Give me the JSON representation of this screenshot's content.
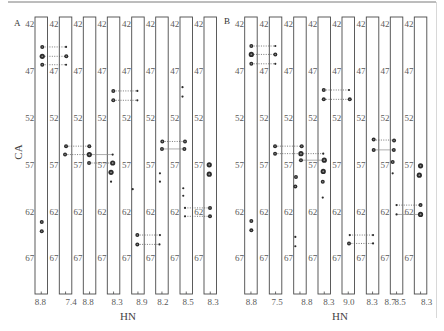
{
  "figure": {
    "panel_labels": [
      "A",
      "B"
    ]
  },
  "chart_data": [
    {
      "type": "scatter",
      "panel": "A",
      "title": "",
      "xlabel": "HN",
      "ylabel": "CA",
      "ca_range": [
        41.2,
        70.8
      ],
      "y_ticks": [
        42,
        47,
        52,
        57,
        62,
        67
      ],
      "grid": false,
      "strip_count": 8,
      "x_tick_labels": [
        {
          "strip": 0,
          "label": "8.8"
        },
        {
          "strip": 1,
          "label": "7.4"
        },
        {
          "strip": 2,
          "label": "8.8"
        },
        {
          "strip": 3,
          "label": "8.3"
        },
        {
          "strip": 4,
          "label": "8.9"
        },
        {
          "strip": 5,
          "label": "8.2"
        },
        {
          "strip": 6,
          "label": "8.5"
        },
        {
          "strip": 7,
          "label": "8.3"
        }
      ],
      "peaks": [
        {
          "id": "a0",
          "strip": 0,
          "ca": 44.4,
          "hn_rel": 0.08,
          "intensity": 2
        },
        {
          "id": "a1",
          "strip": 0,
          "ca": 45.4,
          "hn_rel": 0.08,
          "intensity": 3
        },
        {
          "id": "a2",
          "strip": 0,
          "ca": 46.3,
          "hn_rel": 0.08,
          "intensity": 2
        },
        {
          "id": "a3",
          "strip": 0,
          "ca": 63.1,
          "hn_rel": 0.04,
          "intensity": 2
        },
        {
          "id": "a4",
          "strip": 0,
          "ca": 64.1,
          "hn_rel": 0.04,
          "intensity": 2
        },
        {
          "id": "a5",
          "strip": 1,
          "ca": 44.4,
          "hn_rel": 0.04,
          "intensity": 1
        },
        {
          "id": "a6",
          "strip": 1,
          "ca": 45.4,
          "hn_rel": 0.06,
          "intensity": 2
        },
        {
          "id": "a7",
          "strip": 1,
          "ca": 46.3,
          "hn_rel": 0.04,
          "intensity": 1
        },
        {
          "id": "a8",
          "strip": 1,
          "ca": 55.0,
          "hn_rel": 0.04,
          "intensity": 2
        },
        {
          "id": "a9",
          "strip": 1,
          "ca": 55.9,
          "hn_rel": -0.04,
          "intensity": 2
        },
        {
          "id": "a10",
          "strip": 2,
          "ca": 55.0,
          "hn_rel": -0.02,
          "intensity": 2
        },
        {
          "id": "a11",
          "strip": 2,
          "ca": 55.9,
          "hn_rel": -0.02,
          "intensity": 3
        },
        {
          "id": "a12",
          "strip": 2,
          "ca": 56.8,
          "hn_rel": -0.04,
          "intensity": 2
        },
        {
          "id": "a13",
          "strip": 3,
          "ca": 49.1,
          "hn_rel": -0.02,
          "intensity": 2
        },
        {
          "id": "a14",
          "strip": 3,
          "ca": 50.1,
          "hn_rel": -0.02,
          "intensity": 2
        },
        {
          "id": "a15",
          "strip": 3,
          "ca": 55.9,
          "hn_rel": -0.07,
          "intensity": 1
        },
        {
          "id": "a16",
          "strip": 3,
          "ca": 56.8,
          "hn_rel": -0.07,
          "intensity": 3
        },
        {
          "id": "a17",
          "strip": 3,
          "ca": 57.8,
          "hn_rel": -0.2,
          "intensity": 3
        },
        {
          "id": "a18",
          "strip": 3,
          "ca": 58.8,
          "hn_rel": -0.2,
          "intensity": 1
        },
        {
          "id": "a19",
          "strip": 4,
          "ca": 49.1,
          "hn_rel": -0.05,
          "intensity": 1
        },
        {
          "id": "a20",
          "strip": 4,
          "ca": 50.1,
          "hn_rel": -0.05,
          "intensity": 1
        },
        {
          "id": "a21",
          "strip": 4,
          "ca": 59.6,
          "hn_rel": -0.42,
          "intensity": 1
        },
        {
          "id": "a22",
          "strip": 4,
          "ca": 64.5,
          "hn_rel": -0.05,
          "intensity": 2
        },
        {
          "id": "a23",
          "strip": 4,
          "ca": 65.5,
          "hn_rel": -0.05,
          "intensity": 2
        },
        {
          "id": "a24",
          "strip": 5,
          "ca": 54.5,
          "hn_rel": 0.03,
          "intensity": 2
        },
        {
          "id": "a25",
          "strip": 5,
          "ca": 55.3,
          "hn_rel": 0.0,
          "intensity": 2
        },
        {
          "id": "a26",
          "strip": 5,
          "ca": 57.9,
          "hn_rel": -0.16,
          "intensity": 1
        },
        {
          "id": "a27",
          "strip": 5,
          "ca": 58.8,
          "hn_rel": -0.16,
          "intensity": 1
        },
        {
          "id": "a28",
          "strip": 5,
          "ca": 64.5,
          "hn_rel": -0.16,
          "intensity": 1
        },
        {
          "id": "a29",
          "strip": 5,
          "ca": 65.5,
          "hn_rel": -0.2,
          "intensity": 1
        },
        {
          "id": "a30",
          "strip": 6,
          "ca": 48.7,
          "hn_rel": -0.3,
          "intensity": 1
        },
        {
          "id": "a31",
          "strip": 6,
          "ca": 49.7,
          "hn_rel": -0.3,
          "intensity": 1
        },
        {
          "id": "a32",
          "strip": 6,
          "ca": 54.5,
          "hn_rel": -0.1,
          "intensity": 2
        },
        {
          "id": "a33",
          "strip": 6,
          "ca": 55.3,
          "hn_rel": -0.15,
          "intensity": 2
        },
        {
          "id": "a34",
          "strip": 6,
          "ca": 59.5,
          "hn_rel": -0.24,
          "intensity": 1
        },
        {
          "id": "a35",
          "strip": 6,
          "ca": 60.3,
          "hn_rel": -0.24,
          "intensity": 1
        },
        {
          "id": "a36",
          "strip": 6,
          "ca": 61.6,
          "hn_rel": -0.1,
          "intensity": 1
        },
        {
          "id": "a37",
          "strip": 6,
          "ca": 62.5,
          "hn_rel": -0.1,
          "intensity": 1
        },
        {
          "id": "a38",
          "strip": 7,
          "ca": 57.0,
          "hn_rel": -0.08,
          "intensity": 3
        },
        {
          "id": "a39",
          "strip": 7,
          "ca": 58.0,
          "hn_rel": -0.08,
          "intensity": 3
        },
        {
          "id": "a40",
          "strip": 7,
          "ca": 61.6,
          "hn_rel": -0.02,
          "intensity": 2
        },
        {
          "id": "a41",
          "strip": 7,
          "ca": 62.5,
          "hn_rel": -0.02,
          "intensity": 2
        }
      ],
      "connections": [
        {
          "from": "a0",
          "to": "a5",
          "style": "dotted"
        },
        {
          "from": "a1",
          "to": "a6",
          "style": "dotted"
        },
        {
          "from": "a2",
          "to": "a7",
          "style": "dotted"
        },
        {
          "from": "a8",
          "to": "a10",
          "style": "dotted"
        },
        {
          "from": "a9",
          "to": "a11",
          "style": "dotted"
        },
        {
          "from": "a11",
          "to": "a15",
          "style": "solid"
        },
        {
          "from": "a12",
          "to": "a16",
          "style": "dotted"
        },
        {
          "from": "a13",
          "to": "a19",
          "style": "dotted"
        },
        {
          "from": "a14",
          "to": "a20",
          "style": "dotted"
        },
        {
          "from": "a22",
          "to": "a28",
          "style": "dotted"
        },
        {
          "from": "a23",
          "to": "a29",
          "style": "dotted"
        },
        {
          "from": "a24",
          "to": "a32",
          "style": "dotted"
        },
        {
          "from": "a25",
          "to": "a33",
          "style": "solid"
        },
        {
          "from": "a36",
          "to": "a40",
          "style": "dotted"
        },
        {
          "from": "a37",
          "to": "a41",
          "style": "dotted"
        }
      ]
    },
    {
      "type": "scatter",
      "panel": "B",
      "title": "",
      "xlabel": "HN",
      "ylabel": "",
      "ca_range": [
        41.2,
        70.8
      ],
      "y_ticks": [
        42,
        47,
        52,
        57,
        62,
        67
      ],
      "grid": false,
      "strip_count": 8,
      "x_tick_labels": [
        {
          "strip": 0,
          "label": "8.8"
        },
        {
          "strip": 1,
          "label": "7.5"
        },
        {
          "strip": 2,
          "label": "8.8"
        },
        {
          "strip": 3,
          "label": "8.3"
        },
        {
          "strip": 4,
          "label": "9.0"
        },
        {
          "strip": 5,
          "label": "8.3"
        },
        {
          "strip": 6,
          "label": "8.7"
        },
        {
          "strip": 6,
          "label": "8.5"
        },
        {
          "strip": 7,
          "label": "8.3"
        }
      ],
      "peaks": [
        {
          "id": "b0",
          "strip": 0,
          "ca": 44.3,
          "hn_rel": 0.03,
          "intensity": 2
        },
        {
          "id": "b1",
          "strip": 0,
          "ca": 45.2,
          "hn_rel": 0.03,
          "intensity": 3
        },
        {
          "id": "b2",
          "strip": 0,
          "ca": 46.2,
          "hn_rel": 0.03,
          "intensity": 2
        },
        {
          "id": "b3",
          "strip": 0,
          "ca": 63.0,
          "hn_rel": 0.03,
          "intensity": 2
        },
        {
          "id": "b4",
          "strip": 0,
          "ca": 64.0,
          "hn_rel": 0.03,
          "intensity": 2
        },
        {
          "id": "b5",
          "strip": 1,
          "ca": 44.3,
          "hn_rel": -0.02,
          "intensity": 1
        },
        {
          "id": "b6",
          "strip": 1,
          "ca": 45.2,
          "hn_rel": -0.02,
          "intensity": 2
        },
        {
          "id": "b7",
          "strip": 1,
          "ca": 46.2,
          "hn_rel": -0.02,
          "intensity": 1
        },
        {
          "id": "b8",
          "strip": 1,
          "ca": 55.0,
          "hn_rel": -0.04,
          "intensity": 2
        },
        {
          "id": "b9",
          "strip": 1,
          "ca": 55.8,
          "hn_rel": -0.04,
          "intensity": 2
        },
        {
          "id": "b10",
          "strip": 2,
          "ca": 55.0,
          "hn_rel": 0.14,
          "intensity": 2
        },
        {
          "id": "b11",
          "strip": 2,
          "ca": 55.8,
          "hn_rel": 0.08,
          "intensity": 3
        },
        {
          "id": "b12",
          "strip": 2,
          "ca": 56.5,
          "hn_rel": 0.08,
          "intensity": 2
        },
        {
          "id": "b13",
          "strip": 2,
          "ca": 58.3,
          "hn_rel": -0.32,
          "intensity": 2
        },
        {
          "id": "b14",
          "strip": 2,
          "ca": 59.3,
          "hn_rel": -0.37,
          "intensity": 2
        },
        {
          "id": "b15",
          "strip": 2,
          "ca": 64.7,
          "hn_rel": -0.37,
          "intensity": 1
        },
        {
          "id": "b16",
          "strip": 2,
          "ca": 65.7,
          "hn_rel": -0.37,
          "intensity": 1
        },
        {
          "id": "b17",
          "strip": 3,
          "ca": 49.0,
          "hn_rel": -0.04,
          "intensity": 2
        },
        {
          "id": "b18",
          "strip": 3,
          "ca": 50.0,
          "hn_rel": -0.04,
          "intensity": 2
        },
        {
          "id": "b19",
          "strip": 3,
          "ca": 55.8,
          "hn_rel": -0.08,
          "intensity": 1
        },
        {
          "id": "b20",
          "strip": 3,
          "ca": 56.5,
          "hn_rel": 0.0,
          "intensity": 3
        },
        {
          "id": "b21",
          "strip": 3,
          "ca": 57.7,
          "hn_rel": -0.08,
          "intensity": 3
        },
        {
          "id": "b22",
          "strip": 3,
          "ca": 58.8,
          "hn_rel": -0.12,
          "intensity": 2
        },
        {
          "id": "b23",
          "strip": 3,
          "ca": 60.5,
          "hn_rel": -0.12,
          "intensity": 1
        },
        {
          "id": "b24",
          "strip": 4,
          "ca": 49.0,
          "hn_rel": 0.06,
          "intensity": 1
        },
        {
          "id": "b25",
          "strip": 4,
          "ca": 50.0,
          "hn_rel": 0.12,
          "intensity": 2
        },
        {
          "id": "b26",
          "strip": 4,
          "ca": 64.5,
          "hn_rel": 0.12,
          "intensity": 1
        },
        {
          "id": "b27",
          "strip": 4,
          "ca": 65.4,
          "hn_rel": 0.06,
          "intensity": 2
        },
        {
          "id": "b28",
          "strip": 5,
          "ca": 54.3,
          "hn_rel": 0.09,
          "intensity": 2
        },
        {
          "id": "b29",
          "strip": 5,
          "ca": 55.4,
          "hn_rel": 0.09,
          "intensity": 2
        },
        {
          "id": "b30",
          "strip": 5,
          "ca": 64.5,
          "hn_rel": 0.04,
          "intensity": 1
        },
        {
          "id": "b31",
          "strip": 5,
          "ca": 65.4,
          "hn_rel": 0.04,
          "intensity": 1
        },
        {
          "id": "b32",
          "strip": 6,
          "ca": 54.4,
          "hn_rel": -0.2,
          "intensity": 2
        },
        {
          "id": "b33",
          "strip": 6,
          "ca": 55.4,
          "hn_rel": -0.22,
          "intensity": 2
        },
        {
          "id": "b34",
          "strip": 6,
          "ca": 56.7,
          "hn_rel": -0.31,
          "intensity": 2
        },
        {
          "id": "b35",
          "strip": 6,
          "ca": 57.9,
          "hn_rel": -0.31,
          "intensity": 1
        },
        {
          "id": "b36",
          "strip": 6,
          "ca": 61.3,
          "hn_rel": 0.0,
          "intensity": 1
        },
        {
          "id": "b37",
          "strip": 6,
          "ca": 62.3,
          "hn_rel": 0.0,
          "intensity": 1
        },
        {
          "id": "b38",
          "strip": 7,
          "ca": 57.1,
          "hn_rel": 0.0,
          "intensity": 3
        },
        {
          "id": "b39",
          "strip": 7,
          "ca": 58.1,
          "hn_rel": -0.1,
          "intensity": 3
        },
        {
          "id": "b40",
          "strip": 7,
          "ca": 61.3,
          "hn_rel": 0.0,
          "intensity": 2
        },
        {
          "id": "b41",
          "strip": 7,
          "ca": 62.3,
          "hn_rel": 0.0,
          "intensity": 3
        }
      ],
      "connections": [
        {
          "from": "b0",
          "to": "b5",
          "style": "dotted"
        },
        {
          "from": "b1",
          "to": "b6",
          "style": "dotted"
        },
        {
          "from": "b2",
          "to": "b7",
          "style": "dotted"
        },
        {
          "from": "b8",
          "to": "b10",
          "style": "dotted"
        },
        {
          "from": "b9",
          "to": "b11",
          "style": "dotted"
        },
        {
          "from": "b11",
          "to": "b19",
          "style": "dotted"
        },
        {
          "from": "b12",
          "to": "b20",
          "style": "solid"
        },
        {
          "from": "b17",
          "to": "b24",
          "style": "dotted"
        },
        {
          "from": "b18",
          "to": "b25",
          "style": "dotted"
        },
        {
          "from": "b26",
          "to": "b30",
          "style": "dotted"
        },
        {
          "from": "b27",
          "to": "b31",
          "style": "dotted"
        },
        {
          "from": "b28",
          "to": "b32",
          "style": "dotted"
        },
        {
          "from": "b29",
          "to": "b33",
          "style": "solid"
        },
        {
          "from": "b36",
          "to": "b40",
          "style": "dotted"
        },
        {
          "from": "b37",
          "to": "b41",
          "style": "solid"
        }
      ]
    }
  ]
}
